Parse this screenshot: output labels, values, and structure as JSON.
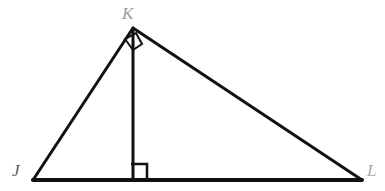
{
  "figure": {
    "kind": "geometry-diagram",
    "background_color": "#ffffff",
    "stroke_color": "#111111",
    "stroke_width": 3,
    "canvas": {
      "width": 385,
      "height": 191
    }
  },
  "vertices": [
    {
      "name": "J",
      "label": "J",
      "x": 33,
      "y": 180,
      "label_x": 12,
      "label_y": 162,
      "label_color": "#5a5a5a"
    },
    {
      "name": "K",
      "label": "K",
      "x": 133,
      "y": 28,
      "label_x": 122,
      "label_y": 5,
      "label_color": "#9b9b9b"
    },
    {
      "name": "L",
      "label": "L",
      "x": 362,
      "y": 180,
      "label_x": 367,
      "label_y": 162,
      "label_color": "#a8a8a8"
    }
  ],
  "segments": [
    {
      "name": "side-JK",
      "from": "J",
      "to": "K",
      "x1": 33,
      "y1": 180,
      "x2": 133,
      "y2": 28,
      "width": 3
    },
    {
      "name": "side-KL",
      "from": "K",
      "to": "L",
      "x1": 133,
      "y1": 28,
      "x2": 362,
      "y2": 180,
      "width": 3
    },
    {
      "name": "side-JL",
      "from": "J",
      "to": "L",
      "x1": 33,
      "y1": 180,
      "x2": 362,
      "y2": 180,
      "width": 4
    },
    {
      "name": "altitude-KM",
      "from": "K",
      "to": "foot",
      "x1": 133,
      "y1": 28,
      "x2": 133,
      "y2": 180,
      "width": 3
    }
  ],
  "right_angle_marks": [
    {
      "name": "right-angle-at-foot",
      "at": "altitude-foot",
      "points": "131,164 147,164 147,180",
      "width": 2.5
    },
    {
      "name": "right-angle-at-K",
      "at": "K",
      "points": "125,39 133,50 142,44 136,33",
      "width": 2
    }
  ]
}
